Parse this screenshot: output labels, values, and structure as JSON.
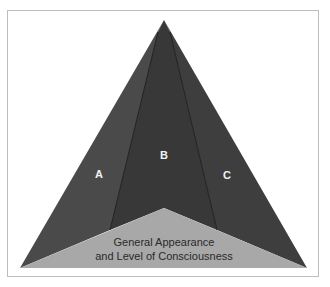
{
  "diagram": {
    "colors": {
      "frame": "#bdbdbd",
      "region_a": "#4a4a4a",
      "region_b": "#383838",
      "region_c": "#3e3e3e",
      "base": "#a8a8a8",
      "divider": "#1e1e1e",
      "label": "#f2f2f2",
      "caption": "#2a2a2a"
    },
    "regions": [
      {
        "id": "A",
        "label": "A"
      },
      {
        "id": "B",
        "label": "B"
      },
      {
        "id": "C",
        "label": "C"
      }
    ],
    "base": {
      "caption_line1": "General Appearance",
      "caption_line2": "and Level of Consciousness"
    }
  }
}
